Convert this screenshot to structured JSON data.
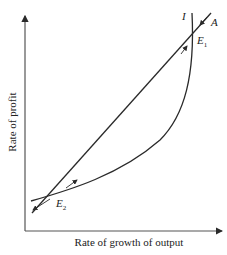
{
  "diagram": {
    "axes": {
      "x_label": "Rate of growth of output",
      "y_label": "Rate of profit"
    },
    "curves": [
      {
        "name": "I",
        "label": "I",
        "kind": "curve"
      },
      {
        "name": "A",
        "label": "A",
        "kind": "line"
      }
    ],
    "equilibria": [
      {
        "name": "E1",
        "label": "E",
        "subscript": "1",
        "stability": "stable"
      },
      {
        "name": "E2",
        "label": "E",
        "subscript": "2",
        "stability": "unstable"
      }
    ],
    "colors": {
      "line": "#2a2a2a",
      "background": "#ffffff"
    }
  }
}
